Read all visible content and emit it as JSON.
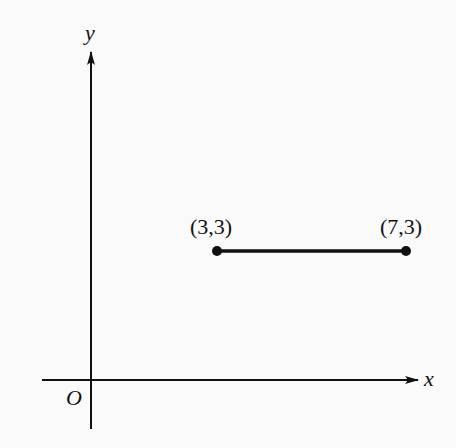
{
  "diagram": {
    "axes": {
      "x_label": "x",
      "y_label": "y",
      "origin_label": "O"
    },
    "segment": {
      "start": {
        "label": "(3,3)",
        "x": 3,
        "y": 3
      },
      "end": {
        "label": "(7,3)",
        "x": 7,
        "y": 3
      }
    },
    "colors": {
      "ink": "#111111",
      "background": "#fafafa"
    }
  }
}
